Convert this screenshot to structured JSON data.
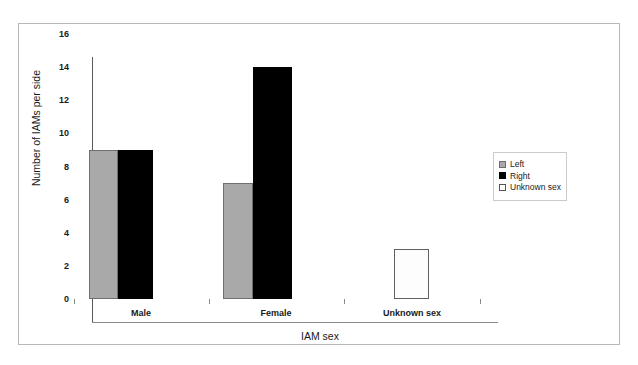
{
  "chart_data": {
    "type": "bar",
    "title": "",
    "xlabel": "IAM sex",
    "ylabel": "Number of IAMs per side",
    "categories": [
      "Male",
      "Female",
      "Unknown sex"
    ],
    "series": [
      {
        "name": "Left",
        "color": "#a9a9a9",
        "values": [
          9,
          7,
          null
        ]
      },
      {
        "name": "Right",
        "color": "#000000",
        "values": [
          9,
          14,
          null
        ]
      },
      {
        "name": "Unknown sex",
        "color": "#ffffff",
        "values": [
          null,
          null,
          3
        ]
      }
    ],
    "ylim": [
      0,
      16
    ],
    "yticks": [
      0,
      2,
      4,
      6,
      8,
      10,
      12,
      14,
      16
    ],
    "ytick_labels": [
      "0",
      "2",
      "4",
      "6",
      "8",
      "10",
      "12",
      "14",
      "16"
    ],
    "grid": false,
    "legend_position": "right"
  },
  "legend": {
    "items": [
      {
        "label": "Left",
        "swatch": "gray-square-icon"
      },
      {
        "label": "Right",
        "swatch": "black-square-icon"
      },
      {
        "label": "Unknown sex",
        "swatch": "white-square-icon"
      }
    ]
  }
}
